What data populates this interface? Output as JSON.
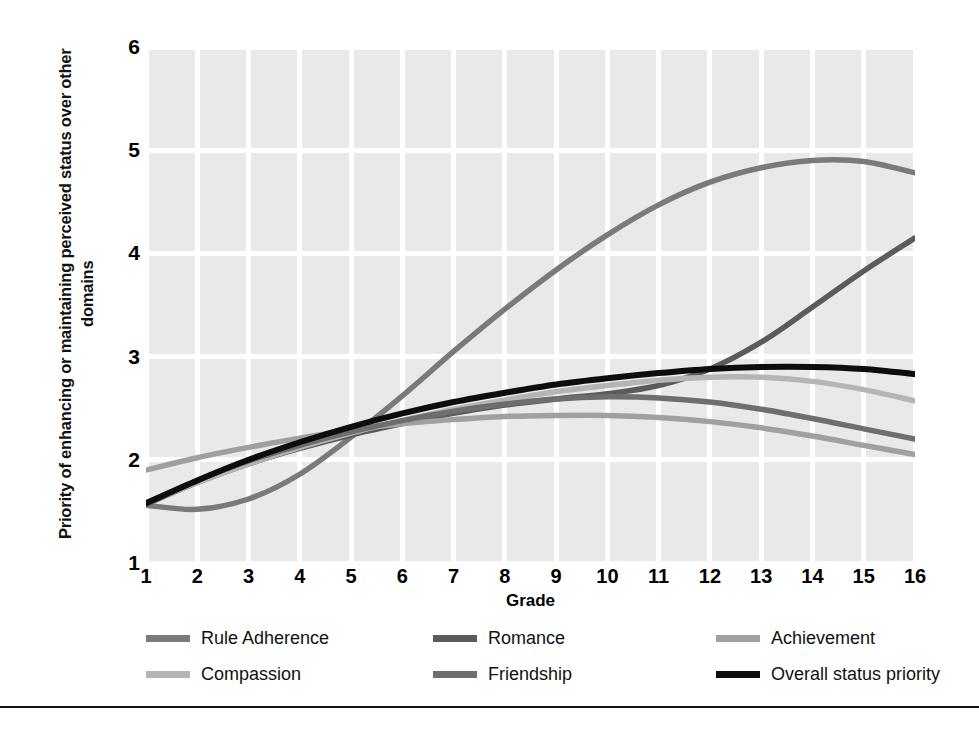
{
  "chart_data": {
    "type": "line",
    "title": "",
    "xlabel": "Grade",
    "ylabel": "Priority of enhancing or maintaining perceived status over other domains",
    "xlim": [
      1,
      16
    ],
    "ylim": [
      1,
      6
    ],
    "grid": true,
    "legend_position": "bottom",
    "x": [
      1,
      2,
      3,
      4,
      5,
      6,
      7,
      8,
      9,
      10,
      11,
      12,
      13,
      14,
      15,
      16
    ],
    "xtick_labels": [
      "1",
      "2",
      "3",
      "4",
      "5",
      "6",
      "7",
      "8",
      "9",
      "10",
      "11",
      "12",
      "13",
      "14",
      "15",
      "16"
    ],
    "ytick_labels": [
      "1",
      "2",
      "3",
      "4",
      "5",
      "6"
    ],
    "series": [
      {
        "name": "Rule Adherence",
        "color": "#7a7a7a",
        "values": [
          1.56,
          1.52,
          1.62,
          1.86,
          2.22,
          2.62,
          3.05,
          3.46,
          3.84,
          4.18,
          4.47,
          4.69,
          4.83,
          4.9,
          4.89,
          4.78
        ]
      },
      {
        "name": "Romance",
        "color": "#5b5b5b",
        "values": [
          1.57,
          1.78,
          1.96,
          2.11,
          2.24,
          2.35,
          2.45,
          2.53,
          2.59,
          2.64,
          2.72,
          2.88,
          3.14,
          3.48,
          3.83,
          4.15
        ]
      },
      {
        "name": "Achievement",
        "color": "#a0a0a0",
        "values": [
          1.9,
          2.02,
          2.12,
          2.21,
          2.29,
          2.35,
          2.39,
          2.42,
          2.43,
          2.43,
          2.41,
          2.37,
          2.31,
          2.23,
          2.14,
          2.05
        ]
      },
      {
        "name": "Compassion",
        "color": "#b5b5b5",
        "values": [
          1.58,
          1.78,
          1.96,
          2.12,
          2.26,
          2.38,
          2.49,
          2.58,
          2.66,
          2.72,
          2.77,
          2.8,
          2.8,
          2.76,
          2.68,
          2.57
        ]
      },
      {
        "name": "Friendship",
        "color": "#6e6e6e",
        "values": [
          1.57,
          1.8,
          1.99,
          2.14,
          2.27,
          2.38,
          2.47,
          2.54,
          2.59,
          2.61,
          2.6,
          2.56,
          2.49,
          2.4,
          2.3,
          2.2
        ]
      },
      {
        "name": "Overall status priority",
        "color": "#0d0d0d",
        "values": [
          1.58,
          1.8,
          2.0,
          2.17,
          2.32,
          2.45,
          2.56,
          2.65,
          2.73,
          2.79,
          2.84,
          2.88,
          2.9,
          2.9,
          2.88,
          2.83
        ]
      }
    ]
  },
  "legend": {
    "rows": [
      [
        {
          "label": "Rule Adherence",
          "color": "#7a7a7a"
        },
        {
          "label": "Romance",
          "color": "#5b5b5b"
        },
        {
          "label": "Achievement",
          "color": "#a0a0a0"
        }
      ],
      [
        {
          "label": "Compassion",
          "color": "#b5b5b5"
        },
        {
          "label": "Friendship",
          "color": "#6e6e6e"
        },
        {
          "label": "Overall status priority",
          "color": "#0d0d0d"
        }
      ]
    ]
  }
}
